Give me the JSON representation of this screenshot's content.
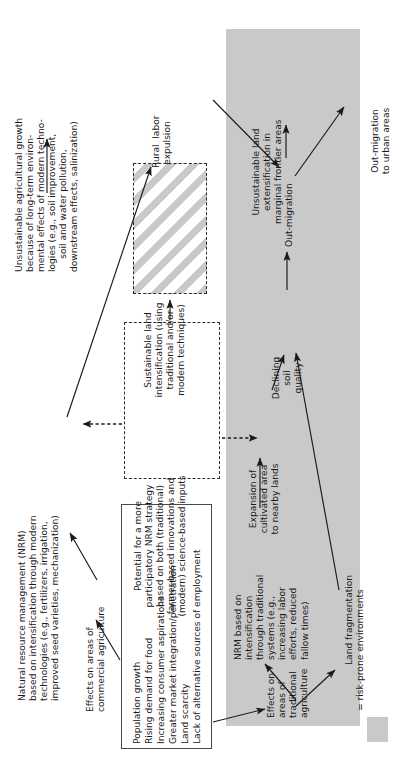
{
  "figure": {
    "type": "flow-diagram",
    "orientation": "text rotated 90 degrees counter-clockwise"
  },
  "nodes": {
    "unsustainable_ag_growth": "Unsustainable agricultural growth\nbecause of long-term environ-\nmental effects of modern techno-\nlogies (e.g., soil improvement,\nsoil and water pollution,\ndownstream effects, salinization)",
    "nrm_modern": "Natural resource management (NRM)\nbased on intensification through modern\ntechnologies (e.g., fertilizers, irrigation,\nimproved seed varieties, mechanization)",
    "effects_commercial": "Effects on areas of\ncommercial agriculture",
    "rural_labor_expulsion": "Rural  labor\nexpulsion",
    "sustainable_land_intensification": "Sustainable land\nintensification (using\ntraditional and/or\nmodern techniques)",
    "participatory_nrm": "Potential for a more\nparticipatory NRM strategy\nbased on both (traditional)\nfarmer-based innovations and\n(modern) science-based inputs",
    "drivers_list": [
      "Population growth",
      "Rising demand for food",
      "Increasing consumer aspirations",
      "Greater market integration/penetration",
      "Land scarcity",
      "Lack of alternative sources of employment"
    ],
    "effects_traditional": "Effects on\nareas of\ntraditional\nagriculture",
    "nrm_traditional": "NRM based on\nintensification\nthrough traditional\nsystems (e.g.,\nincreasing labor\nefforts, reduced\nfallow times)",
    "land_fragmentation": "Land fragmentation",
    "expansion_cultivated": "Expansion of\ncultivated area\nto nearby lands",
    "declining_soil_quality": "Declining\nsoil\nquality",
    "out_migration": "Out-migration",
    "unsustainable_extensification": "Unsustainable land\nextensification in\nmarginal frontier areas",
    "out_migration_urban": "Out-migration\nto urban areas"
  },
  "legend": {
    "swatch_label": "= risk-prone environments",
    "swatch_color": "#c9c9c9"
  },
  "colors": {
    "risk_zone": "#c9c9c9",
    "ink": "#1a1a1a",
    "page": "#ffffff"
  }
}
